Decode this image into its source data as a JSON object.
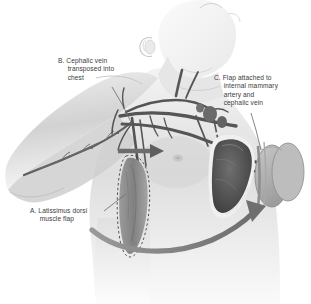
{
  "figure": {
    "background_color": "#ffffff",
    "text_color": "#3a3a3a",
    "style": "grayscale medical illustration"
  },
  "callouts": [
    {
      "key": "A",
      "name": "callout-a",
      "text": "A. Latissimus dorsi\n     muscle flap",
      "lines": [
        "A. Latissimus dorsi",
        "muscle flap"
      ],
      "leader_from": [
        103,
        211
      ],
      "leader_to": [
        124,
        193
      ]
    },
    {
      "key": "B",
      "name": "callout-b",
      "text": "B. Cephalic vein\n     transposed into\n     chest",
      "lines": [
        "B. Cephalic vein",
        "transposed into",
        "chest"
      ],
      "leader_from": [
        112,
        86
      ],
      "leader_to": [
        131,
        122
      ]
    },
    {
      "key": "C",
      "name": "callout-c",
      "text": "C. Flap attached to\n     internal mammary\n     artery and\n     cephalic vein",
      "lines": [
        "C. Flap attached to",
        "internal mammary",
        "artery and",
        "cephalic vein"
      ],
      "leader_from": [
        251,
        112
      ],
      "leader_to": [
        261,
        148
      ]
    }
  ],
  "anatomy": {
    "body_fill": "#d8d8d8",
    "body_fill_light": "#ececec",
    "body_shadow": "#b9b9b9",
    "vessel_color": "#5a5a5a",
    "vessel_dark": "#3f3f3f",
    "flap_fill": "#8f8f8f",
    "flap_dark": "#6e6e6e",
    "arrow_color": "#7c7c7c",
    "dash_color": "#4a4a4a",
    "parts": [
      "head",
      "neck",
      "chin",
      "ear",
      "shoulder",
      "upper-arm",
      "torso",
      "breast-mound",
      "latissimus-dorsi-flap",
      "cephalic-vein",
      "internal-mammary-vessels",
      "subclavian-vessels",
      "skin-paddle-discs",
      "transposition-arrow",
      "flow-arrow"
    ]
  }
}
